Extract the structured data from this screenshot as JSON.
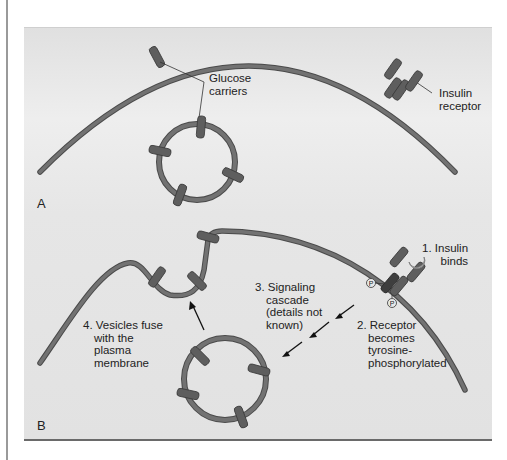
{
  "figure": {
    "panels": [
      {
        "letter": "A",
        "labels": {
          "glucose_carriers_1": "Glucose",
          "glucose_carriers_2": "carriers",
          "insulin_receptor_1": "Insulin",
          "insulin_receptor_2": "receptor"
        }
      },
      {
        "letter": "B",
        "labels": {
          "step1_1": "1. Insulin",
          "step1_2": "binds",
          "step2_1": "2. Receptor",
          "step2_2": "becomes",
          "step2_3": "tyrosine-",
          "step2_4": "phosphorylated",
          "step3_1": "3. Signaling",
          "step3_2": "cascade",
          "step3_3": "(details not",
          "step3_4": "known)",
          "step4_1": "4. Vesicles fuse",
          "step4_2": "with the",
          "step4_3": "plasma",
          "step4_4": "membrane",
          "phosphate": "P"
        }
      }
    ],
    "colors": {
      "background": "#e4e4e4",
      "membrane": "#707070",
      "membrane_outline": "#4a4a4a",
      "carrier": "#5e5e5e",
      "insulin": "#b8b8b8",
      "text": "#222222"
    }
  }
}
